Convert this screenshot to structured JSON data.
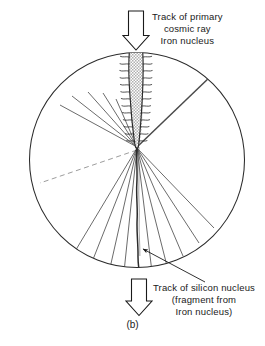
{
  "figure": {
    "caption": "(b)",
    "background_color": "#ffffff",
    "ink_color": "#1a1a1a"
  },
  "annotations": {
    "primary_track": {
      "line1": "Track of primary",
      "line2": "cosmic ray",
      "line3": "Iron nucleus",
      "arrow_direction": "down",
      "arrow_name": "down-arrow-primary"
    },
    "secondary_track": {
      "line1": "Track of silicon nucleus",
      "line2": "(fragment from",
      "line3": "Iron nucleus)",
      "arrow_direction": "down",
      "arrow_name": "down-arrow-secondary"
    }
  },
  "diagram": {
    "type": "particle-track-emulsion",
    "field_of_view": {
      "shape": "circle",
      "center_x": 137,
      "center_y": 160,
      "radius": 108,
      "stroke": "#2b2b2b",
      "stroke_width": 1.0
    },
    "interaction_vertex": {
      "x": 137,
      "y": 147,
      "label": "interaction-vertex"
    },
    "primary_track": {
      "name": "iron-nucleus-track",
      "description": "thick stippled track entering from top of field with delta-ray whiskers",
      "entry_x": 136,
      "entry_y": 53,
      "end_x": 137,
      "end_y": 147,
      "width_top": 13,
      "width_bottom": 3,
      "fill": "#c9c9c9",
      "stroke": "#2b2b2b"
    },
    "secondary_track": {
      "name": "silicon-nucleus-track",
      "description": "thin wavy track continuing downward from vertex out of field",
      "start_x": 137,
      "start_y": 147,
      "exit_x": 139,
      "exit_y": 268,
      "stroke": "#2b2b2b",
      "stroke_width": 1.4
    },
    "delta_ray_whiskers": {
      "name": "delta-ray-whiskers",
      "count": 26,
      "description": "short hair-like electron tracks branching from both sides of the primary track"
    },
    "upward_secondaries": {
      "name": "backward-secondary-tracks",
      "count": 5,
      "description": "tracks radiating up and to the left of the vertex"
    },
    "prominent_secondary": {
      "name": "prominent-secondary-track",
      "description": "single heavier track from vertex toward upper right edge of field",
      "angle_deg": 42
    },
    "dashed_secondary": {
      "name": "dashed-secondary-track",
      "description": "faint dashed track from vertex toward lower left",
      "style": "dashed"
    },
    "forward_cone": {
      "name": "forward-secondary-track-fan",
      "count": 9,
      "description": "narrow fan of secondary particle tracks emitted downward from the vertex"
    },
    "leader_line": {
      "name": "secondary-track-leader-line",
      "from_x": 205,
      "from_y": 283,
      "to_x": 142,
      "to_y": 248,
      "has_arrowhead": true
    }
  }
}
